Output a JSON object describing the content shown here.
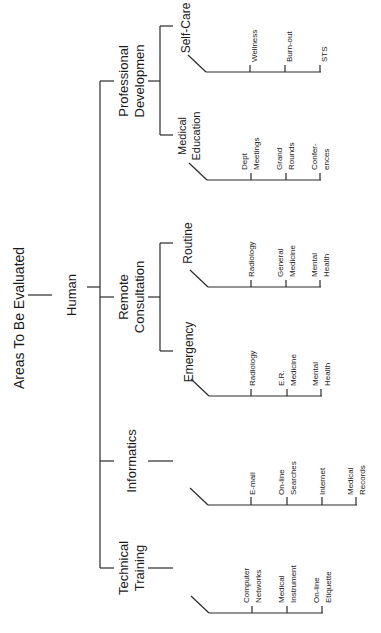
{
  "title": "Areas To Be Evaluated",
  "root": "Human",
  "branches": {
    "professional_development": {
      "label": [
        "Professional",
        "Developmen"
      ],
      "self_care": {
        "label": "Self-Care",
        "items": [
          "Wellness",
          "Burn-out",
          "STS"
        ]
      },
      "medical_education": {
        "label": [
          "Medical",
          "Education"
        ],
        "items": [
          [
            "Dept",
            "Meetings"
          ],
          [
            "Grand",
            "Rounds"
          ],
          [
            "Confer-",
            "ences"
          ]
        ]
      }
    },
    "remote_consultation": {
      "label": [
        "Remote",
        "Consultation"
      ],
      "routine": {
        "label": "Routine",
        "items": [
          [
            "Radiology"
          ],
          [
            "General",
            "Medicine"
          ],
          [
            "Mental",
            "Health"
          ]
        ]
      },
      "emergency": {
        "label": "Emergency",
        "items": [
          [
            "Radiology"
          ],
          [
            "E.R.",
            "Medicine"
          ],
          [
            "Mental",
            "Health"
          ]
        ]
      }
    },
    "informatics": {
      "label": "Informatics",
      "items": [
        [
          "E-mail"
        ],
        [
          "On-line",
          "Searches"
        ],
        [
          "Internet"
        ],
        [
          "Medical",
          "Records"
        ]
      ]
    },
    "technical_training": {
      "label": [
        "Technical",
        "Training"
      ],
      "items": [
        [
          "Computer",
          "Networks"
        ],
        [
          "Medical",
          "Instrument"
        ],
        [
          "On-line",
          "Etiquette"
        ]
      ]
    }
  }
}
